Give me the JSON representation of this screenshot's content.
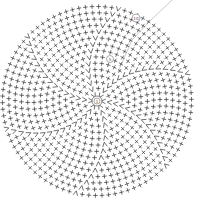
{
  "diagram": {
    "type": "crochet-round-chart",
    "center": {
      "x": 97,
      "y": 101
    },
    "rounds": 15,
    "round_spacing": 6.3,
    "wedges": 6,
    "stitch_color": "#333333",
    "guide_line_color": "#bbbbbb",
    "round_markers": [
      {
        "label": "1",
        "round": 0
      },
      {
        "label": "5",
        "round": 5
      },
      {
        "label": "10",
        "round": 14
      }
    ],
    "symbols": {
      "single_crochet": "+",
      "increase": "V"
    }
  }
}
